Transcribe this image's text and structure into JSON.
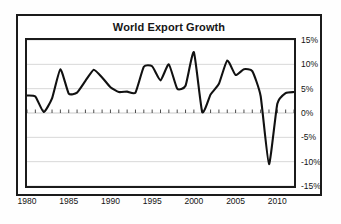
{
  "chart_data": {
    "type": "line",
    "title": "World Export Growth",
    "xlabel": "",
    "ylabel": "",
    "xlim": [
      1980,
      2012
    ],
    "ylim": [
      -15,
      15
    ],
    "grid": true,
    "legend": null,
    "y_ticks": [
      15,
      10,
      5,
      0,
      -5,
      -10,
      -15
    ],
    "y_tick_labels": [
      "15%",
      "10%",
      "5%",
      "0%",
      "-5%",
      "-10%",
      "-15%"
    ],
    "x_ticks": [
      1980,
      1985,
      1990,
      1995,
      2000,
      2005,
      2010
    ],
    "x_tick_labels": [
      "1980",
      "1985",
      "1990",
      "1995",
      "2000",
      "2005",
      "2010"
    ],
    "x_minor_tick_interval": 1,
    "series": [
      {
        "name": "World Export Growth",
        "color": "#111111",
        "x": [
          1980,
          1981,
          1982,
          1983,
          1984,
          1985,
          1986,
          1987,
          1988,
          1989,
          1990,
          1991,
          1992,
          1993,
          1994,
          1995,
          1996,
          1997,
          1998,
          1999,
          2000,
          2001,
          2002,
          2003,
          2004,
          2005,
          2006,
          2007,
          2008,
          2009,
          2010,
          2011,
          2012
        ],
        "values": [
          3.6,
          3.4,
          0.2,
          3.0,
          9.0,
          4.0,
          4.2,
          6.6,
          8.9,
          7.3,
          5.3,
          4.3,
          4.4,
          4.2,
          9.5,
          9.6,
          6.7,
          10.0,
          5.0,
          5.6,
          12.5,
          0.2,
          3.8,
          6.0,
          10.8,
          7.8,
          9.0,
          8.6,
          3.5,
          -10.5,
          1.9,
          4.1,
          4.3
        ]
      }
    ]
  },
  "axis_labels": {
    "y": [
      "15%",
      "10%",
      "5%",
      "0%",
      "-5%",
      "-10%",
      "-15%"
    ],
    "x": [
      "1980",
      "1985",
      "1990",
      "1995",
      "2000",
      "2005",
      "2010"
    ]
  },
  "colors": {
    "line": "#111111",
    "frame": "#1b1b1b",
    "grid": "#d8d8d8",
    "background": "#ffffff",
    "text": "#131313"
  }
}
